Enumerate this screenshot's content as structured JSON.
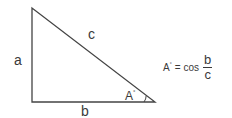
{
  "diagram": {
    "type": "right-triangle",
    "vertices": {
      "top": [
        32,
        8
      ],
      "right_angle": [
        32,
        102
      ],
      "angle_A": [
        155,
        102
      ]
    },
    "stroke_color": "#444444",
    "side_labels": {
      "hypotenuse": "c",
      "vertical_leg": "a",
      "horizontal_leg": "b"
    },
    "angle_label": {
      "letter": "A",
      "degree_mark": "°"
    },
    "formula": {
      "lhs": "A",
      "lhs_degree": "°",
      "equals": "=",
      "function": "cos",
      "numerator": "b",
      "denominator": "c"
    }
  }
}
